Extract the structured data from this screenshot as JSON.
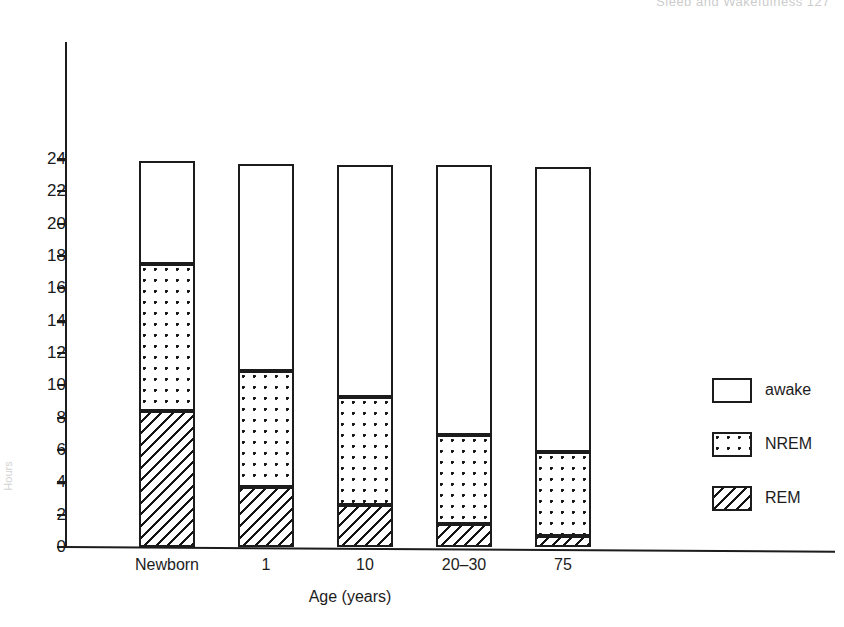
{
  "page": {
    "running_header": "Sleep and Wakefulness   127",
    "y_axis_title": "Hours"
  },
  "chart_data": {
    "type": "bar",
    "stacked": true,
    "title": "",
    "xlabel": "Age (years)",
    "ylabel": "",
    "categories": [
      "Newborn",
      "1",
      "10",
      "20–30",
      "75"
    ],
    "ylim": [
      0,
      25
    ],
    "yticks": [
      0,
      2,
      4,
      6,
      8,
      10,
      12,
      14,
      16,
      18,
      20,
      22,
      24
    ],
    "ytick_labels": [
      "0",
      "2",
      "4",
      "6",
      "8",
      "10",
      "12",
      "14",
      "16",
      "18",
      "20",
      "22",
      "24"
    ],
    "grid": false,
    "legend_position": "right",
    "series": [
      {
        "name": "REM",
        "pattern": "diagonal-hatch",
        "values": [
          8.4,
          3.7,
          2.6,
          1.4,
          0.7
        ]
      },
      {
        "name": "NREM",
        "pattern": "dotted",
        "values": [
          9.1,
          7.2,
          6.7,
          5.5,
          5.2
        ]
      },
      {
        "name": "awake",
        "pattern": "blank",
        "values": [
          6.4,
          12.8,
          14.3,
          16.7,
          17.6
        ]
      }
    ],
    "cumulative_tops": {
      "rem": [
        8.4,
        3.7,
        2.6,
        1.4,
        0.7
      ],
      "nrem": [
        17.5,
        10.9,
        9.3,
        6.9,
        5.9
      ],
      "awake": [
        23.9,
        23.7,
        23.6,
        23.6,
        23.5
      ]
    },
    "legend": [
      {
        "label": "awake",
        "pattern": "blank"
      },
      {
        "label": "NREM",
        "pattern": "dotted"
      },
      {
        "label": "REM",
        "pattern": "diagonal-hatch"
      }
    ]
  }
}
